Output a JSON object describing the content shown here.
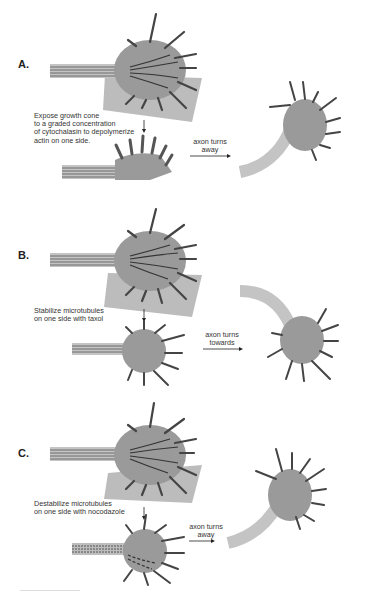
{
  "figure": {
    "colors": {
      "cone_fill": "#9a9a9a",
      "filopodia": "#444444",
      "microtubule": "#3a3a3a",
      "axon_fill": "#bdbdbd",
      "drug_patch": "#bcbcbc",
      "arrow": "#222222"
    },
    "panels": [
      {
        "label": "A.",
        "caption": "Expose growth cone\nto a graded concentration\nof cytochalasin to depolymerize\nactin on one side.",
        "result_label": "axon turns\naway"
      },
      {
        "label": "B.",
        "caption": "Stabilize microtubules\non one side with taxol",
        "result_label": "axon turns\ntowards"
      },
      {
        "label": "C.",
        "caption": "Destabilize microtubules\non one side with nocodazole",
        "result_label": "axon turns\naway"
      }
    ]
  }
}
